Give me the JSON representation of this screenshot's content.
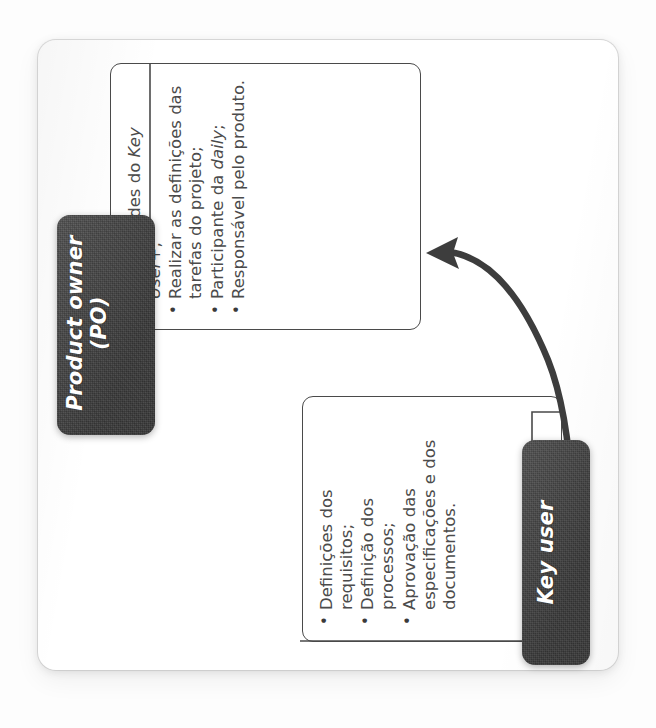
{
  "diagram": {
    "orientation": "rotated-90-ccw",
    "accent_dark": "#3f3f3f",
    "stroke": "#4a4a4a",
    "page_background": "#ffffff",
    "roles": [
      {
        "id": "product-owner",
        "tab_line1": "Product owner",
        "tab_line2": "(PO)",
        "bullets": [
          {
            "pre": "As atividades do ",
            "em": "Key User",
            "post": "+;"
          },
          {
            "pre": "Realizar as definições das tarefas do projeto;",
            "em": "",
            "post": ""
          },
          {
            "pre": "Participante da ",
            "em": "daily",
            "post": ";"
          },
          {
            "pre": "Responsável pelo produto.",
            "em": "",
            "post": ""
          }
        ]
      },
      {
        "id": "key-user",
        "tab_line1": "Key user",
        "tab_line2": "",
        "bullets": [
          {
            "pre": "Definições dos requisitos;",
            "em": "",
            "post": ""
          },
          {
            "pre": "Definição dos processos;",
            "em": "",
            "post": ""
          },
          {
            "pre": "Aprovação das especificações e dos documentos.",
            "em": "",
            "post": ""
          }
        ]
      }
    ],
    "connection": {
      "from": "key-user",
      "to": "product-owner",
      "style": "curved-arrow"
    }
  }
}
